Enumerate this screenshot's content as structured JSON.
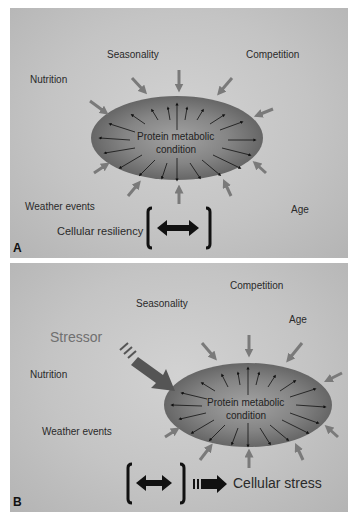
{
  "panel_a": {
    "letter": "A",
    "center_label_line1": "Protein metabolic",
    "center_label_line2": "condition",
    "factors": {
      "seasonality": "Seasonality",
      "competition": "Competition",
      "nutrition": "Nutrition",
      "weather_events": "Weather events",
      "age": "Age"
    },
    "resiliency_label": "Cellular resiliency"
  },
  "panel_b": {
    "letter": "B",
    "center_label_line1": "Protein metabolic",
    "center_label_line2": "condition",
    "stressor_label": "Stressor",
    "factors": {
      "competition": "Competition",
      "seasonality": "Seasonality",
      "age": "Age",
      "nutrition": "Nutrition",
      "weather_events": "Weather events"
    },
    "outcome_label": "Cellular stress"
  },
  "colors": {
    "background": "#c6c6c6",
    "ellipse_edge": "#6a6a6a",
    "ellipse_center": "#9a9a9a",
    "external_arrow": "#7a7a7a",
    "dark_arrow": "#111111"
  }
}
